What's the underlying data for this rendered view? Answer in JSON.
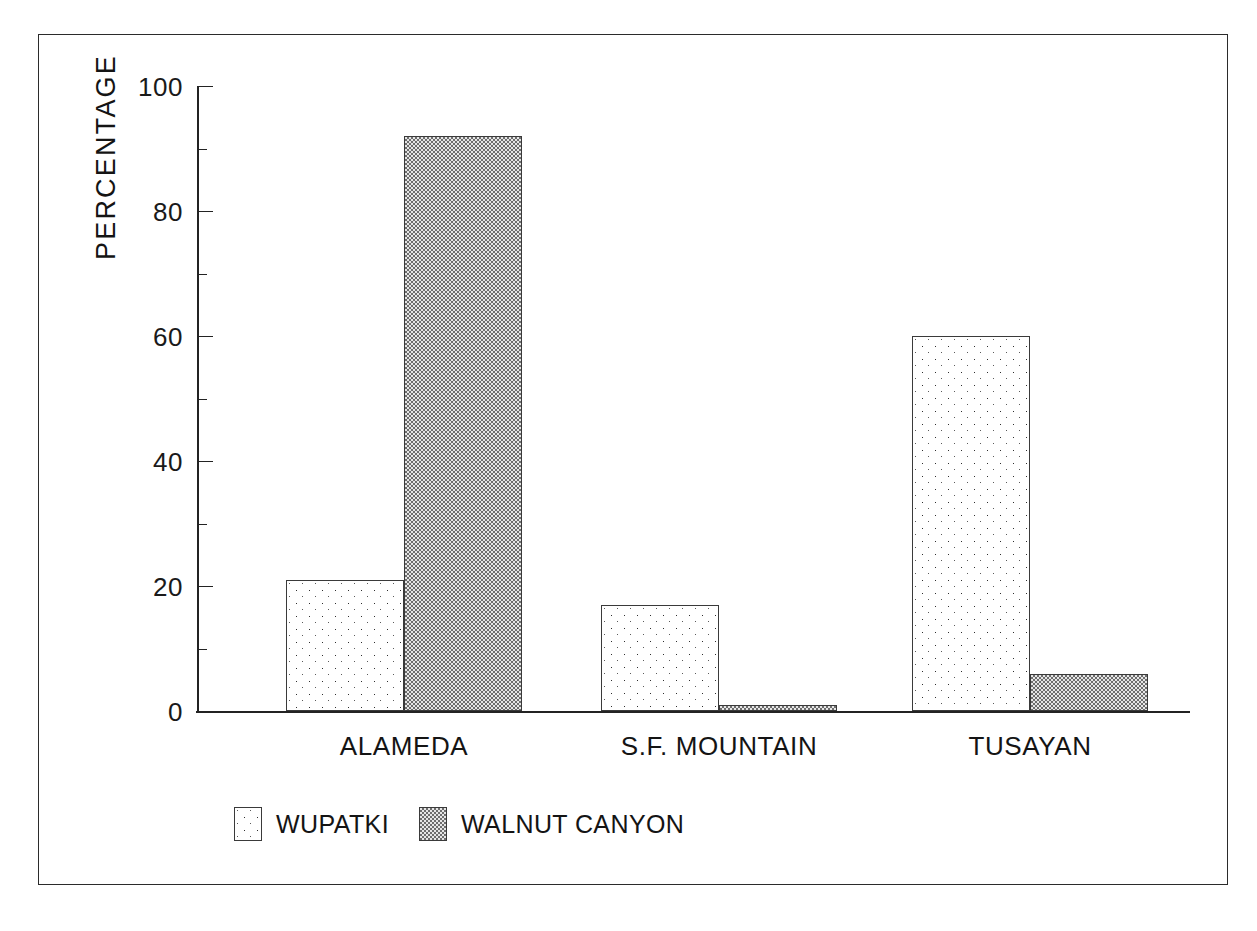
{
  "chart_data": {
    "type": "bar",
    "title": "",
    "subtitle": "",
    "xlabel": "",
    "ylabel": "PERCENTAGE",
    "ylim": [
      0,
      100
    ],
    "grid": false,
    "legend_position": "bottom-left",
    "categories": [
      "ALAMEDA",
      "S.F. MOUNTAIN",
      "TUSAYAN"
    ],
    "series": [
      {
        "name": "WUPATKI",
        "values": [
          21,
          17,
          60
        ],
        "pattern": "sparse-dot-stipple"
      },
      {
        "name": "WALNUT CANYON",
        "values": [
          92,
          1,
          6
        ],
        "pattern": "dense-checker-stipple"
      }
    ],
    "y_major_ticks": [
      0,
      20,
      40,
      60,
      80,
      100
    ],
    "y_minor_ticks": [
      10,
      30,
      50,
      70,
      90
    ],
    "y_tick_labels": [
      "0",
      "20",
      "40",
      "60",
      "80",
      "100"
    ]
  },
  "axis": {
    "y_title": "PERCENTAGE",
    "ticks": [
      {
        "value": 100,
        "label": "100",
        "major": true
      },
      {
        "value": 90,
        "label": "",
        "major": false
      },
      {
        "value": 80,
        "label": "80",
        "major": true
      },
      {
        "value": 70,
        "label": "",
        "major": false
      },
      {
        "value": 60,
        "label": "60",
        "major": true
      },
      {
        "value": 50,
        "label": "",
        "major": false
      },
      {
        "value": 40,
        "label": "40",
        "major": true
      },
      {
        "value": 30,
        "label": "",
        "major": false
      },
      {
        "value": 20,
        "label": "20",
        "major": true
      },
      {
        "value": 10,
        "label": "",
        "major": false
      },
      {
        "value": 0,
        "label": "0",
        "major": true
      }
    ]
  },
  "legend": {
    "entries": [
      {
        "label": "WUPATKI"
      },
      {
        "label": "WALNUT CANYON"
      }
    ]
  },
  "colors": {
    "ink": "#1a1a1a",
    "axis": "#232323",
    "bar_outline": "#3a3a3a",
    "wupatki_fill": "#ffffff",
    "walnut_fill": "#d2d2d2",
    "background": "#ffffff"
  }
}
